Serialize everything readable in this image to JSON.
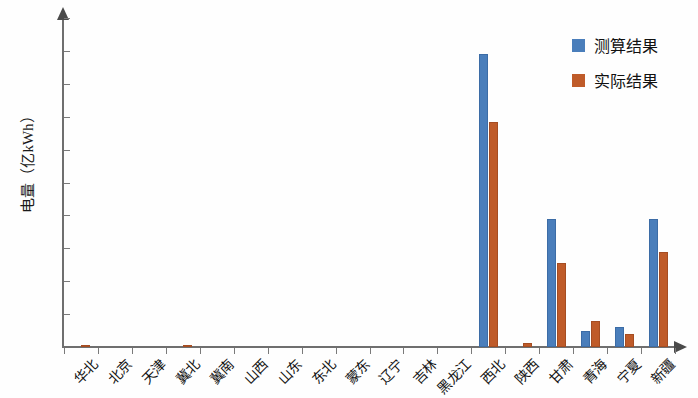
{
  "chart_data": {
    "type": "bar",
    "title": "",
    "xlabel": "",
    "ylabel": "电量（亿kWh）",
    "ylim": [
      0,
      100
    ],
    "ytick_step": 10,
    "yticks": [
      0,
      10,
      20,
      30,
      40,
      50,
      60,
      70,
      80,
      90,
      100
    ],
    "grid": false,
    "legend_position": "top-right",
    "categories": [
      "华北",
      "北京",
      "天津",
      "冀北",
      "冀南",
      "山西",
      "山东",
      "东北",
      "蒙东",
      "辽宁",
      "吉林",
      "黑龙江",
      "西北",
      "陕西",
      "甘肃",
      "青海",
      "宁夏",
      "新疆"
    ],
    "series": [
      {
        "name": "测算结果",
        "color": "#4a7ebb",
        "values": [
          0,
          0,
          0,
          0,
          0,
          0,
          0,
          0,
          0,
          0,
          0,
          0,
          89,
          0,
          39,
          5,
          6,
          39
        ]
      },
      {
        "name": "实际结果",
        "color": "#bf5b29",
        "values": [
          0.2,
          0,
          0,
          0.2,
          0,
          0,
          0,
          0,
          0,
          0,
          0,
          0,
          68.5,
          1.3,
          25.5,
          8,
          4,
          29
        ]
      }
    ]
  },
  "axes": {
    "y_label": "电量（亿kWh）",
    "y_tick_labels": [
      "0",
      "10",
      "20",
      "30",
      "40",
      "50",
      "60",
      "70",
      "80",
      "90",
      "100"
    ],
    "x_tick_labels": [
      "华北",
      "北京",
      "天津",
      "冀北",
      "冀南",
      "山西",
      "山东",
      "东北",
      "蒙东",
      "辽宁",
      "吉林",
      "黑龙江",
      "西北",
      "陕西",
      "甘肃",
      "青海",
      "宁夏",
      "新疆"
    ]
  },
  "legend": {
    "items": [
      {
        "label": "测算结果",
        "color": "#4a7ebb"
      },
      {
        "label": "实际结果",
        "color": "#bf5b29"
      }
    ]
  }
}
